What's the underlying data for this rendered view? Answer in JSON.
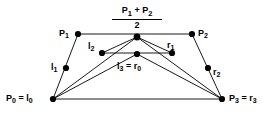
{
  "figure": {
    "width": 275,
    "height": 122,
    "background_color": "#ffffff",
    "line_color": "#000000",
    "dot_color": "#000000",
    "text_color": "#000000"
  },
  "points": [
    {
      "id": "P0",
      "label_html": "P<sub>0</sub> = l<sub>0</sub>",
      "x": 53,
      "y": 99
    },
    {
      "id": "P1",
      "label_html": "P<sub>1</sub>",
      "x": 78,
      "y": 34
    },
    {
      "id": "P2",
      "label_html": "P<sub>2</sub>",
      "x": 192,
      "y": 34
    },
    {
      "id": "P3",
      "label_html": "P<sub>3</sub> = r<sub>3</sub>",
      "x": 222,
      "y": 99
    },
    {
      "id": "l1",
      "label_html": "l<sub>1</sub>",
      "x": 66,
      "y": 68
    },
    {
      "id": "l2",
      "label_html": "l<sub>2</sub>",
      "x": 102,
      "y": 53
    },
    {
      "id": "l3r0",
      "label_html": "l<sub>3</sub> = r<sub>0</sub>",
      "x": 137,
      "y": 54
    },
    {
      "id": "r1",
      "label_html": "r<sub>1</sub>",
      "x": 172,
      "y": 53
    },
    {
      "id": "r2",
      "label_html": "r<sub>2</sub>",
      "x": 208,
      "y": 68
    },
    {
      "id": "mid12",
      "label_html": "",
      "x": 137,
      "y": 37
    }
  ],
  "labels": {
    "p0": "P0 = l0",
    "p1": "P1",
    "p2": "P2",
    "p3": "P3 = r3",
    "l1": "l1",
    "l2": "l2",
    "l3r0": "l3 = r0",
    "r1": "r1",
    "r2": "r2",
    "midpoint_numerator": "P1 + P2",
    "midpoint_denominator": "2"
  },
  "segments": [
    {
      "name": "p1-p2-top",
      "from": "P1",
      "to": "P2"
    },
    {
      "name": "p0-p1",
      "from": "P0",
      "to": "P1"
    },
    {
      "name": "p2-p3",
      "from": "P2",
      "to": "P3"
    },
    {
      "name": "p0-p3-base",
      "from": "P0",
      "to": "P3"
    },
    {
      "name": "l2-r1-middle",
      "from": "l2",
      "to": "r1"
    },
    {
      "name": "l2-mid12",
      "from": "l2",
      "to": "mid12"
    },
    {
      "name": "mid12-r1",
      "from": "mid12",
      "to": "r1"
    },
    {
      "name": "p0-l3r0",
      "from": "P0",
      "to": "l3r0"
    },
    {
      "name": "l3r0-p3",
      "from": "l3r0",
      "to": "P3"
    },
    {
      "name": "p0-mid12",
      "from": "P0",
      "to": "mid12"
    },
    {
      "name": "mid12-p3",
      "from": "mid12",
      "to": "P3"
    }
  ]
}
